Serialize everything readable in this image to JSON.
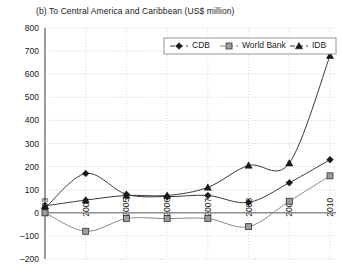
{
  "chart_data": {
    "type": "line",
    "title": "(b) To Central America and Caribbean (US$ million)",
    "xlabel": "",
    "ylabel": "",
    "categories": [
      "2003",
      "2004",
      "2005",
      "2006",
      "2007",
      "2008",
      "2009",
      "2010"
    ],
    "series": [
      {
        "name": "CDB",
        "marker": "diamond",
        "color": "#1a1a1a",
        "values": [
          20,
          170,
          80,
          70,
          75,
          45,
          130,
          230
        ]
      },
      {
        "name": "World Bank",
        "marker": "square",
        "color": "#8c8c8c",
        "values": [
          0,
          -80,
          -25,
          -25,
          -25,
          -60,
          50,
          160
        ]
      },
      {
        "name": "IDB",
        "marker": "triangle",
        "color": "#1a1a1a",
        "values": [
          30,
          55,
          75,
          75,
          110,
          205,
          215,
          680
        ]
      }
    ],
    "ylim": [
      -200,
      800
    ],
    "ystep": 100,
    "yticks": [
      "800",
      "700",
      "600",
      "500",
      "400",
      "300",
      "200",
      "100",
      "0",
      "-100",
      "-200"
    ],
    "grid": true,
    "legend_position": "top-right",
    "legend_entries": [
      "CDB",
      "World Bank",
      "IDB"
    ]
  }
}
